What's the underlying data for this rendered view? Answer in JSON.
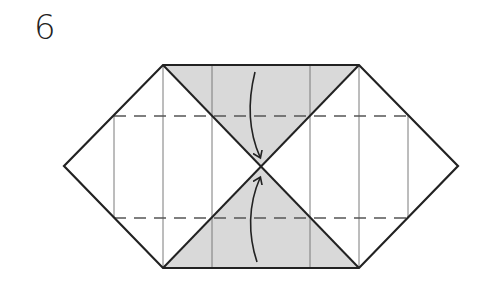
{
  "step": {
    "number": "6"
  },
  "diagram": {
    "colors": {
      "outline": "#222222",
      "crease": "#777777",
      "shade": "#d9d9d9",
      "background": "#ffffff"
    },
    "arrows": [
      {
        "direction": "down",
        "target": "center"
      },
      {
        "direction": "up",
        "target": "center"
      }
    ]
  }
}
